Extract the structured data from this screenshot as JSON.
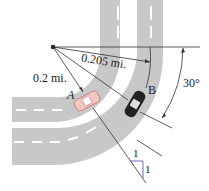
{
  "labels": {
    "inner_radius": "0.2 mi.",
    "outer_radius": "0.205 mi.",
    "angle": "30°",
    "car_a": "A",
    "car_b": "B",
    "slope_run": "1",
    "slope_rise": "1"
  },
  "colors": {
    "road": "#c8c8c8",
    "lane_mark": "#ffffff",
    "line": "#333333",
    "car_a": "#f2c7c0",
    "car_b": "#222222",
    "slope_marker": "#4a4aa8"
  }
}
